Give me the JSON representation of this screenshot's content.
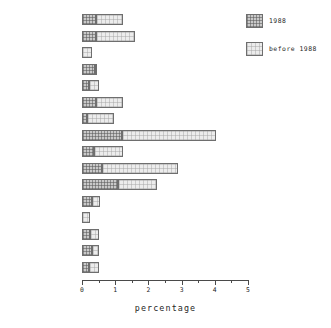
{
  "chart_data": {
    "type": "bar",
    "orientation": "horizontal",
    "stacked": true,
    "title": "",
    "xlabel": "percentage",
    "ylabel": "",
    "xlim": [
      0,
      5
    ],
    "xticks": [
      0,
      1,
      2,
      3,
      4,
      5
    ],
    "xtick_labels": [
      "0",
      "1",
      "2",
      "3",
      "4",
      "5"
    ],
    "minor_xticks": [
      0.5,
      1.5,
      2.5,
      3.5,
      4.5
    ],
    "grid": false,
    "legend_position": "top-right",
    "categories": [
      "TOTAL",
      "EUROPE",
      "ENGLAND & WALES",
      "SCOTLAND",
      "N. IRELAND",
      "HOLLAND",
      "W-GERMANY",
      "SWITZERLAND",
      "BELGIUM",
      "FRANCE",
      "SPAIN",
      "NORWAY",
      "FINLAND",
      "USA",
      "CANADA",
      "AUSTRALIA"
    ],
    "series": [
      {
        "name": "1988",
        "color": "#c9c9c9",
        "values": [
          0.42,
          0.42,
          0.0,
          0.38,
          0.2,
          0.42,
          0.15,
          1.2,
          0.35,
          0.6,
          1.08,
          0.3,
          0.0,
          0.25,
          0.3,
          0.2
        ]
      },
      {
        "name": "before 1988",
        "color": "#ececec",
        "values": [
          0.83,
          1.18,
          0.3,
          0.07,
          0.3,
          0.83,
          0.8,
          2.85,
          0.9,
          2.3,
          1.17,
          0.25,
          0.25,
          0.25,
          0.2,
          0.3
        ]
      }
    ],
    "totals": [
      1.25,
      1.6,
      0.3,
      0.45,
      0.5,
      1.25,
      0.95,
      4.05,
      1.25,
      2.9,
      2.25,
      0.55,
      0.25,
      0.5,
      0.5,
      0.5
    ]
  },
  "legend": {
    "items": [
      {
        "label": "1988",
        "swatch": "recent"
      },
      {
        "label": "before 1988",
        "swatch": "older"
      }
    ]
  },
  "axis": {
    "x_title": "percentage"
  }
}
